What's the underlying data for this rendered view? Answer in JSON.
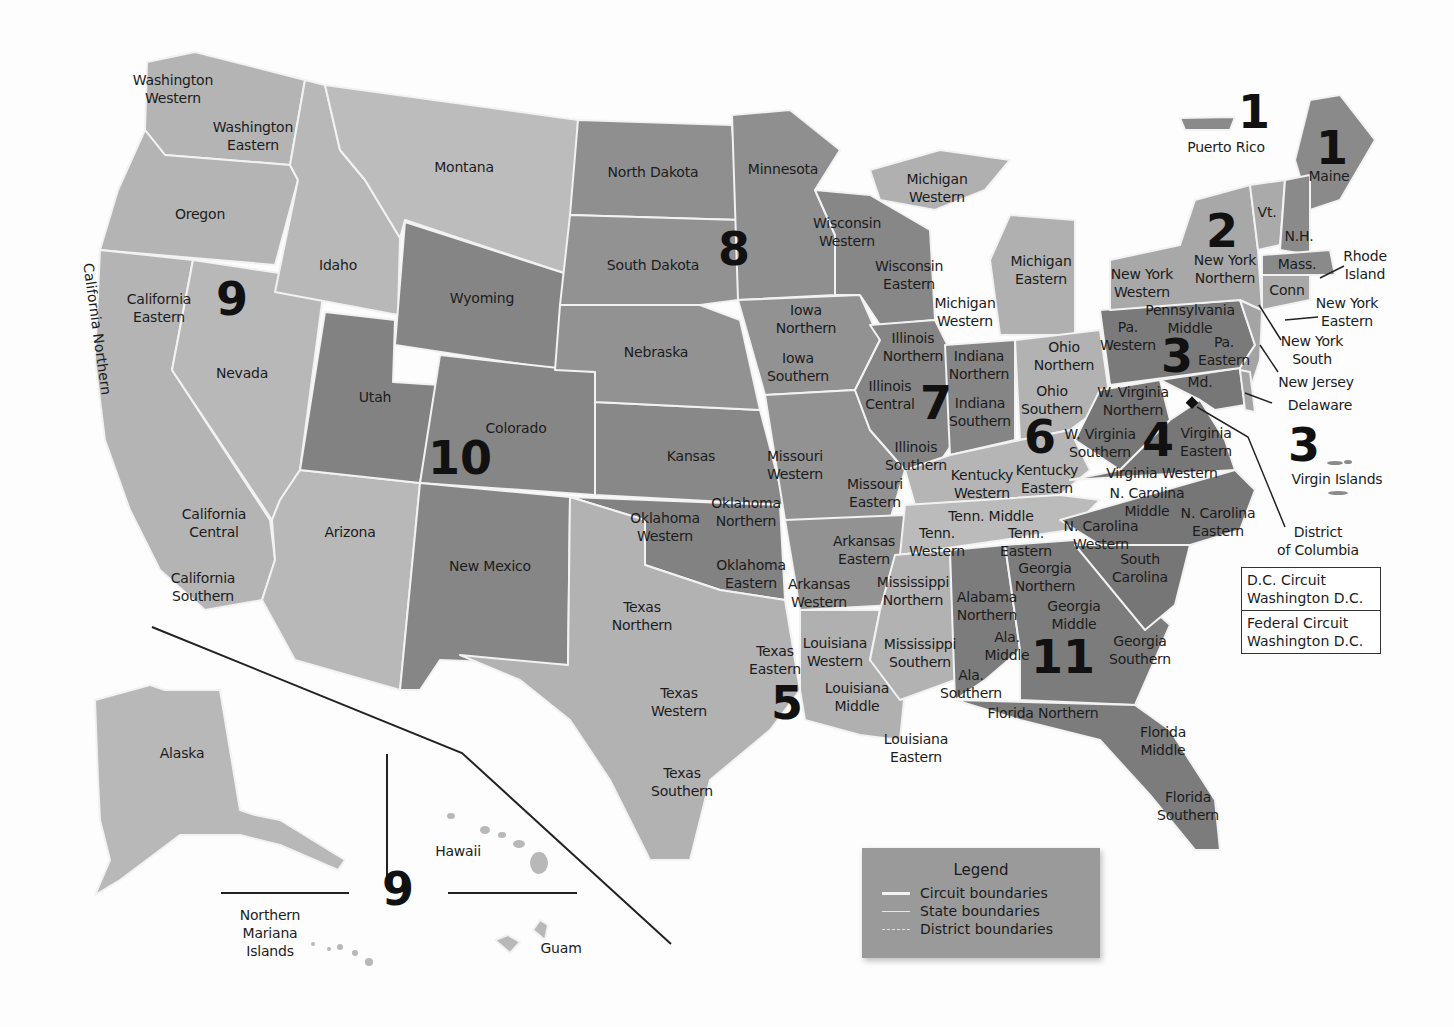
{
  "map": {
    "title": "U.S. Federal Judicial Circuits and Districts",
    "colors": {
      "background": "#fdfdfd",
      "light": "#b8b8b8",
      "medium_light": "#a6a6a6",
      "medium": "#8f8f8f",
      "dark": "#7a7a7a",
      "darker": "#6e6e6e",
      "boundary": "#f2f2f2",
      "text": "#1c1c1c"
    },
    "circuit_numbers": [
      {
        "id": "c1-pr",
        "label": "1",
        "x": 1254,
        "y": 112
      },
      {
        "id": "c1-me",
        "label": "1",
        "x": 1332,
        "y": 148
      },
      {
        "id": "c2",
        "label": "2",
        "x": 1222,
        "y": 231
      },
      {
        "id": "c3",
        "label": "3",
        "x": 1177,
        "y": 356
      },
      {
        "id": "c3-vi",
        "label": "3",
        "x": 1304,
        "y": 445
      },
      {
        "id": "c4",
        "label": "4",
        "x": 1158,
        "y": 440
      },
      {
        "id": "c5",
        "label": "5",
        "x": 787,
        "y": 703
      },
      {
        "id": "c6",
        "label": "6",
        "x": 1040,
        "y": 437
      },
      {
        "id": "c7",
        "label": "7",
        "x": 936,
        "y": 403
      },
      {
        "id": "c8",
        "label": "8",
        "x": 734,
        "y": 249
      },
      {
        "id": "c9",
        "label": "9",
        "x": 232,
        "y": 299
      },
      {
        "id": "c9-pac",
        "label": "9",
        "x": 398,
        "y": 889
      },
      {
        "id": "c10",
        "label": "10",
        "x": 460,
        "y": 458
      },
      {
        "id": "c11",
        "label": "11",
        "x": 1063,
        "y": 657
      }
    ],
    "district_labels": [
      {
        "text": "Washington\nWestern",
        "x": 173,
        "y": 89
      },
      {
        "text": "Washington\nEastern",
        "x": 253,
        "y": 136
      },
      {
        "text": "Montana",
        "x": 464,
        "y": 167
      },
      {
        "text": "Oregon",
        "x": 200,
        "y": 214
      },
      {
        "text": "Idaho",
        "x": 338,
        "y": 265
      },
      {
        "text": "California\nEastern",
        "x": 159,
        "y": 308
      },
      {
        "text": "Nevada",
        "x": 242,
        "y": 373
      },
      {
        "text": "California\nCentral",
        "x": 214,
        "y": 523
      },
      {
        "text": "California\nSouthern",
        "x": 203,
        "y": 587
      },
      {
        "text": "Utah",
        "x": 375,
        "y": 397
      },
      {
        "text": "Wyoming",
        "x": 482,
        "y": 298
      },
      {
        "text": "Colorado",
        "x": 516,
        "y": 428
      },
      {
        "text": "Arizona",
        "x": 350,
        "y": 532
      },
      {
        "text": "New Mexico",
        "x": 490,
        "y": 566
      },
      {
        "text": "North Dakota",
        "x": 653,
        "y": 172
      },
      {
        "text": "South Dakota",
        "x": 653,
        "y": 265
      },
      {
        "text": "Nebraska",
        "x": 656,
        "y": 352
      },
      {
        "text": "Kansas",
        "x": 691,
        "y": 456
      },
      {
        "text": "Minnesota",
        "x": 783,
        "y": 169
      },
      {
        "text": "Iowa\nNorthern",
        "x": 806,
        "y": 319
      },
      {
        "text": "Iowa\nSouthern",
        "x": 798,
        "y": 367
      },
      {
        "text": "Missouri\nWestern",
        "x": 795,
        "y": 465
      },
      {
        "text": "Missouri\nEastern",
        "x": 875,
        "y": 493
      },
      {
        "text": "Oklahoma\nNorthern",
        "x": 746,
        "y": 512
      },
      {
        "text": "Oklahoma\nWestern",
        "x": 665,
        "y": 527
      },
      {
        "text": "Oklahoma\nEastern",
        "x": 751,
        "y": 574
      },
      {
        "text": "Arkansas\nEastern",
        "x": 864,
        "y": 550
      },
      {
        "text": "Arkansas\nWestern",
        "x": 819,
        "y": 593
      },
      {
        "text": "Texas\nNorthern",
        "x": 642,
        "y": 616
      },
      {
        "text": "Texas\nEastern",
        "x": 775,
        "y": 660
      },
      {
        "text": "Texas\nWestern",
        "x": 679,
        "y": 702
      },
      {
        "text": "Texas\nSouthern",
        "x": 682,
        "y": 782
      },
      {
        "text": "Louisiana\nWestern",
        "x": 835,
        "y": 652
      },
      {
        "text": "Louisiana\nMiddle",
        "x": 857,
        "y": 697
      },
      {
        "text": "Louisiana\nEastern",
        "x": 916,
        "y": 748
      },
      {
        "text": "Mississippi\nNorthern",
        "x": 913,
        "y": 591
      },
      {
        "text": "Mississippi\nSouthern",
        "x": 920,
        "y": 653
      },
      {
        "text": "Wisconsin\nWestern",
        "x": 847,
        "y": 232
      },
      {
        "text": "Wisconsin\nEastern",
        "x": 909,
        "y": 275
      },
      {
        "text": "Michigan\nWestern",
        "x": 937,
        "y": 188
      },
      {
        "text": "Michigan\nEastern",
        "x": 1041,
        "y": 270
      },
      {
        "text": "Michigan\nWestern",
        "x": 965,
        "y": 312
      },
      {
        "text": "Illinois\nNorthern",
        "x": 913,
        "y": 347
      },
      {
        "text": "Illinois\nCentral",
        "x": 890,
        "y": 395
      },
      {
        "text": "Illinois\nSouthern",
        "x": 916,
        "y": 456
      },
      {
        "text": "Indiana\nNorthern",
        "x": 979,
        "y": 365
      },
      {
        "text": "Indiana\nSouthern",
        "x": 980,
        "y": 412
      },
      {
        "text": "Ohio\nNorthern",
        "x": 1064,
        "y": 356
      },
      {
        "text": "Ohio\nSouthern",
        "x": 1052,
        "y": 400
      },
      {
        "text": "Kentucky\nWestern",
        "x": 982,
        "y": 484
      },
      {
        "text": "Kentucky\nEastern",
        "x": 1047,
        "y": 479
      },
      {
        "text": "Tenn. Middle",
        "x": 991,
        "y": 516
      },
      {
        "text": "Tenn.\nWestern",
        "x": 937,
        "y": 542
      },
      {
        "text": "Tenn.\nEastern",
        "x": 1026,
        "y": 542
      },
      {
        "text": "Alabama\nNorthern",
        "x": 987,
        "y": 606
      },
      {
        "text": "Ala.\nMiddle",
        "x": 1007,
        "y": 646
      },
      {
        "text": "Ala.\nSouthern",
        "x": 971,
        "y": 684
      },
      {
        "text": "Georgia\nNorthern",
        "x": 1045,
        "y": 577
      },
      {
        "text": "Georgia\nMiddle",
        "x": 1074,
        "y": 615
      },
      {
        "text": "Georgia\nSouthern",
        "x": 1140,
        "y": 650
      },
      {
        "text": "Florida Northern",
        "x": 1043,
        "y": 713
      },
      {
        "text": "Florida\nMiddle",
        "x": 1163,
        "y": 741
      },
      {
        "text": "Florida\nSouthern",
        "x": 1188,
        "y": 806
      },
      {
        "text": "South\nCarolina",
        "x": 1140,
        "y": 568
      },
      {
        "text": "N. Carolina\nWestern",
        "x": 1101,
        "y": 535
      },
      {
        "text": "N. Carolina\nMiddle",
        "x": 1147,
        "y": 502
      },
      {
        "text": "N. Carolina\nEastern",
        "x": 1218,
        "y": 522
      },
      {
        "text": "Virginia Western",
        "x": 1162,
        "y": 473
      },
      {
        "text": "Virginia\nEastern",
        "x": 1206,
        "y": 442
      },
      {
        "text": "W. Virginia\nSouthern",
        "x": 1100,
        "y": 443
      },
      {
        "text": "W. Virginia\nNorthern",
        "x": 1133,
        "y": 401
      },
      {
        "text": "Md.",
        "x": 1200,
        "y": 382
      },
      {
        "text": "Pa.\nWestern",
        "x": 1128,
        "y": 336
      },
      {
        "text": "Pennsylvania\nMiddle",
        "x": 1190,
        "y": 319
      },
      {
        "text": "Pa.\nEastern",
        "x": 1224,
        "y": 351
      },
      {
        "text": "New York\nWestern",
        "x": 1142,
        "y": 283
      },
      {
        "text": "New York\nNorthern",
        "x": 1225,
        "y": 269
      },
      {
        "text": "Vt.",
        "x": 1267,
        "y": 212
      },
      {
        "text": "N.H.",
        "x": 1299,
        "y": 236
      },
      {
        "text": "Maine",
        "x": 1329,
        "y": 176
      },
      {
        "text": "Mass.",
        "x": 1297,
        "y": 264
      },
      {
        "text": "Conn",
        "x": 1287,
        "y": 290
      }
    ],
    "callout_labels": [
      {
        "text": "Puerto Rico",
        "x": 1226,
        "y": 147
      },
      {
        "text": "Rhode\nIsland",
        "x": 1365,
        "y": 265
      },
      {
        "text": "New York\nEastern",
        "x": 1347,
        "y": 312
      },
      {
        "text": "New York\nSouth",
        "x": 1312,
        "y": 350
      },
      {
        "text": "New Jersey",
        "x": 1316,
        "y": 382
      },
      {
        "text": "Delaware",
        "x": 1320,
        "y": 405
      },
      {
        "text": "Virgin Islands",
        "x": 1337,
        "y": 479
      },
      {
        "text": "District\nof Columbia",
        "x": 1318,
        "y": 541
      }
    ],
    "territory_labels": [
      {
        "text": "Alaska",
        "x": 182,
        "y": 753
      },
      {
        "text": "Hawaii",
        "x": 458,
        "y": 851
      },
      {
        "text": "Northern\nMariana\nIslands",
        "x": 270,
        "y": 933
      },
      {
        "text": "Guam",
        "x": 561,
        "y": 948
      }
    ],
    "vertical_label": {
      "text": "California Northern",
      "x": 96,
      "y": 265
    },
    "dc_box": {
      "rows": [
        "D.C. Circuit\nWashington D.C.",
        "Federal Circuit\nWashington D.C."
      ]
    },
    "legend": {
      "title": "Legend",
      "items": [
        {
          "label": "Circuit boundaries",
          "style": "solid-thick"
        },
        {
          "label": "State boundaries",
          "style": "solid-thin"
        },
        {
          "label": "District boundaries",
          "style": "dashed"
        }
      ]
    }
  }
}
